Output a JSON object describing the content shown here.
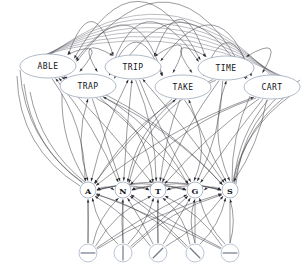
{
  "diagram": {
    "type": "layered-directed-graph",
    "canvas": {
      "width": 304,
      "height": 269,
      "background": "#ffffff"
    },
    "colors": {
      "edge": "#3a3a42",
      "node_outline": "#9aa8bb",
      "feature_outline": "#a8b6c8",
      "node_fill": "#ffffff",
      "label": "#141418",
      "arrowhead": "#2b2b33"
    },
    "layers": [
      {
        "name": "word-layer",
        "shape": "ellipse",
        "count": 6
      },
      {
        "name": "letter-layer",
        "shape": "circle",
        "count": 5
      },
      {
        "name": "feature-layer",
        "shape": "circle",
        "count": 5
      }
    ]
  },
  "word_nodes": [
    {
      "id": "w0",
      "label": "ABLE",
      "cx": 48,
      "cy": 66,
      "rx": 28,
      "ry": 12
    },
    {
      "id": "w1",
      "label": "TRAP",
      "cx": 88,
      "cy": 86,
      "rx": 28,
      "ry": 12
    },
    {
      "id": "w2",
      "label": "TRIP",
      "cx": 133,
      "cy": 67,
      "rx": 28,
      "ry": 12
    },
    {
      "id": "w3",
      "label": "TAKE",
      "cx": 183,
      "cy": 87,
      "rx": 28,
      "ry": 12
    },
    {
      "id": "w4",
      "label": "TIME",
      "cx": 226,
      "cy": 68,
      "rx": 28,
      "ry": 12
    },
    {
      "id": "w5",
      "label": "CART",
      "cx": 272,
      "cy": 87,
      "rx": 28,
      "ry": 12
    }
  ],
  "letter_nodes": [
    {
      "id": "l0",
      "label": "A",
      "cx": 88,
      "cy": 190,
      "r": 8
    },
    {
      "id": "l1",
      "label": "N",
      "cx": 123,
      "cy": 190,
      "r": 8
    },
    {
      "id": "l2",
      "label": "T",
      "cx": 158,
      "cy": 190,
      "r": 8
    },
    {
      "id": "l3",
      "label": "G",
      "cx": 195,
      "cy": 190,
      "r": 8
    },
    {
      "id": "l4",
      "label": "S",
      "cx": 230,
      "cy": 190,
      "r": 8
    }
  ],
  "feature_nodes": [
    {
      "id": "f0",
      "glyph": "horizontal-stroke",
      "cx": 88,
      "cy": 253,
      "r": 9,
      "angle": 0
    },
    {
      "id": "f1",
      "glyph": "vertical-stroke",
      "cx": 123,
      "cy": 253,
      "r": 9,
      "angle": 90
    },
    {
      "id": "f2",
      "glyph": "slash-stroke",
      "cx": 158,
      "cy": 253,
      "r": 9,
      "angle": -45
    },
    {
      "id": "f3",
      "glyph": "backslash-stroke",
      "cx": 195,
      "cy": 253,
      "r": 9,
      "angle": 45
    },
    {
      "id": "f4",
      "glyph": "horizontal-stroke",
      "cx": 230,
      "cy": 253,
      "r": 9,
      "angle": 0
    }
  ]
}
